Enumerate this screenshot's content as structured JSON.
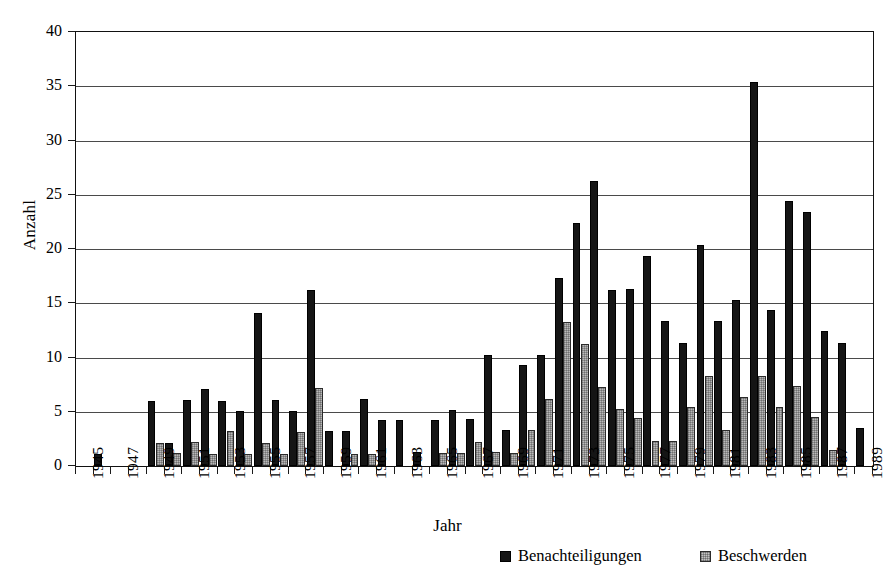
{
  "chart_data": {
    "type": "bar",
    "title": "",
    "xlabel": "Jahr",
    "ylabel": "Anzahl",
    "ylim": [
      0,
      40
    ],
    "yticks": [
      0,
      5,
      10,
      15,
      20,
      25,
      30,
      35,
      40
    ],
    "grid": true,
    "legend_position": "bottom",
    "x_tick_labels": [
      "1945",
      "1947",
      "1949",
      "1951",
      "1953",
      "1955",
      "1957",
      "1959",
      "1961",
      "1963",
      "1965",
      "1967",
      "1969",
      "1971",
      "1973",
      "1975",
      "1977",
      "1979",
      "1981",
      "1983",
      "1985",
      "1987",
      "1989"
    ],
    "categories": [
      "1945",
      "1946",
      "1947",
      "1948",
      "1949",
      "1950",
      "1951",
      "1952",
      "1953",
      "1954",
      "1955",
      "1956",
      "1957",
      "1958",
      "1959",
      "1960",
      "1961",
      "1962",
      "1963",
      "1964",
      "1965",
      "1966",
      "1967",
      "1968",
      "1969",
      "1970",
      "1971",
      "1972",
      "1973",
      "1974",
      "1975",
      "1976",
      "1977",
      "1978",
      "1979",
      "1980",
      "1981",
      "1982",
      "1983",
      "1984",
      "1985",
      "1986",
      "1987",
      "1988",
      "1989"
    ],
    "series": [
      {
        "name": "Benachteiligungen",
        "color": "#151515",
        "values": [
          0,
          1.1,
          0,
          0,
          6.0,
          2.1,
          6.1,
          7.1,
          6.0,
          5.1,
          14.1,
          6.1,
          5.1,
          16.2,
          3.2,
          3.2,
          6.2,
          4.2,
          4.2,
          1.3,
          4.2,
          5.2,
          4.3,
          10.2,
          3.3,
          9.3,
          10.2,
          17.3,
          22.4,
          26.3,
          16.2,
          16.3,
          19.4,
          13.4,
          11.3,
          20.4,
          13.4,
          15.3,
          35.4,
          14.4,
          24.4,
          23.4,
          12.4,
          11.3,
          3.5
        ]
      },
      {
        "name": "Beschwerden",
        "color": "#b9b9b9",
        "values": [
          0,
          0,
          0,
          0,
          2.1,
          1.2,
          2.2,
          1.1,
          3.2,
          1.1,
          2.1,
          1.1,
          3.1,
          7.2,
          0,
          1.1,
          1.1,
          0,
          0,
          0,
          1.2,
          1.2,
          2.2,
          1.3,
          1.2,
          3.3,
          6.2,
          13.3,
          11.2,
          7.3,
          5.3,
          4.4,
          2.3,
          2.3,
          5.4,
          8.3,
          3.3,
          6.4,
          8.3,
          5.4,
          7.4,
          4.5,
          1.5,
          0,
          0
        ]
      }
    ]
  },
  "legend": {
    "items": [
      {
        "label": "Benachteiligungen"
      },
      {
        "label": "Beschwerden"
      }
    ]
  }
}
